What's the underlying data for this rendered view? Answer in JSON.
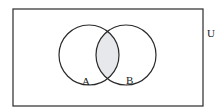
{
  "diagram": {
    "type": "venn",
    "universal_set_label": "U",
    "sets": [
      {
        "label": "A"
      },
      {
        "label": "B"
      }
    ],
    "shaded_region": "A ∩ B",
    "colors": {
      "stroke": "#2a2a2a",
      "shade": "#e6e8ec",
      "background": "#ffffff"
    }
  }
}
